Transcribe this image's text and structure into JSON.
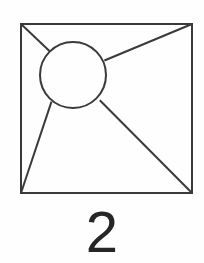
{
  "figure": {
    "caption": "2",
    "background_color": "#fefefe",
    "stroke_color": "#3a3a3a",
    "caption_color": "#262626",
    "stroke_width": 2,
    "square": {
      "name": "outer-square",
      "x": 21,
      "y": 24,
      "width": 171,
      "height": 169
    },
    "circle": {
      "name": "inner-circle",
      "cx": 73,
      "cy": 75,
      "r": 33
    },
    "rays": [
      {
        "name": "ray-top-left",
        "from_corner": "top-left",
        "x1": 21,
        "y1": 24,
        "x2": 49.7,
        "y2": 51.2
      },
      {
        "name": "ray-top-right",
        "from_corner": "top-right",
        "x1": 192,
        "y1": 24,
        "x2": 104.4,
        "y2": 60.5
      },
      {
        "name": "ray-bottom-left",
        "from_corner": "bottom-left",
        "x1": 21,
        "y1": 193,
        "x2": 51.5,
        "y2": 101.6
      },
      {
        "name": "ray-bottom-right",
        "from_corner": "bottom-right",
        "x1": 192,
        "y1": 193,
        "x2": 99.8,
        "y2": 100.3
      }
    ]
  }
}
